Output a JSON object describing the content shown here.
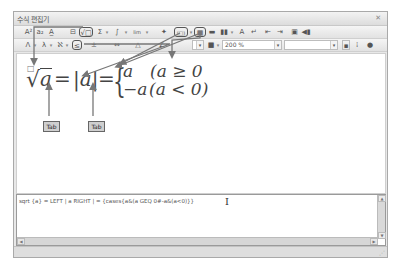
{
  "window": {
    "title": "수식 편집기",
    "close_label": "✕"
  },
  "toolbar1": {
    "buttons": [
      {
        "name": "superscript-button",
        "glyph": "A²"
      },
      {
        "name": "subscript-button",
        "glyph": "a₂"
      },
      {
        "name": "base-script-button",
        "glyph": "A̲"
      },
      {
        "name": "fraction-button",
        "glyph": "⊟"
      },
      {
        "name": "root-button",
        "glyph": "√□"
      },
      {
        "name": "sum-button",
        "glyph": "Σ"
      },
      {
        "name": "integral-button",
        "glyph": "∫ □"
      },
      {
        "name": "limit-button",
        "glyph": "lim"
      },
      {
        "name": "decoration-button",
        "glyph": "✦"
      },
      {
        "name": "bracket-button",
        "glyph": "(□)"
      },
      {
        "name": "matrix-button",
        "glyph": "▦"
      },
      {
        "name": "row-button",
        "glyph": "▬"
      },
      {
        "name": "column-button",
        "glyph": "▮▮"
      },
      {
        "name": "font-button",
        "glyph": "A"
      },
      {
        "name": "newline-button",
        "glyph": "↵"
      },
      {
        "name": "align-left-button",
        "glyph": "⇤"
      },
      {
        "name": "align-right-button",
        "glyph": "⇥"
      },
      {
        "name": "save-button",
        "glyph": "▣"
      },
      {
        "name": "insert-button",
        "glyph": "◀▮"
      }
    ]
  },
  "toolbar2": {
    "buttons": [
      {
        "name": "greek-capital-button",
        "glyph": "Λ"
      },
      {
        "name": "greek-lower-button",
        "glyph": "λ"
      },
      {
        "name": "hebrew-button",
        "glyph": "ℵ"
      },
      {
        "name": "relation-button",
        "glyph": "≤"
      },
      {
        "name": "operator-button",
        "glyph": "±"
      },
      {
        "name": "arrow-button",
        "glyph": "⇔"
      },
      {
        "name": "logic-button",
        "glyph": "△"
      },
      {
        "name": "misc-button",
        "glyph": "∠"
      }
    ],
    "color_glyph": "■",
    "zoom_value": "200 %",
    "font_value": "",
    "extra_icons": [
      "▪",
      "⁞",
      "●"
    ]
  },
  "editor": {
    "formula": {
      "root_index": "□",
      "radical": "√",
      "radicand": "a",
      "eq1": "=",
      "abs": "|a|",
      "eq2": "=",
      "brace": "{",
      "case1_expr": "a",
      "case1_cond": "(a ≥ 0",
      "case2_expr": "−a",
      "case2_cond": "(a < 0)"
    },
    "annotations": [
      "Tab",
      "Tab"
    ]
  },
  "script": {
    "text": "sqrt {a} = LEFT | a RIGHT | = {cases{a&(a GEQ 0#-a&(a<0)}}",
    "cursor": "I"
  },
  "scrollbars": {
    "up": "▲",
    "down": "▼",
    "left": "◀",
    "right": "▶"
  },
  "statusbar": {
    "grip": "⋰"
  }
}
